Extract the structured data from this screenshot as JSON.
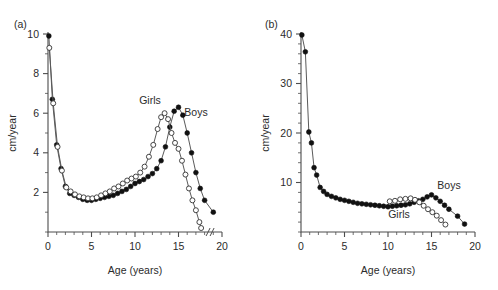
{
  "figure": {
    "panels": [
      {
        "id": "a",
        "label": "(a)",
        "xlabel": "Age (years)",
        "ylabel": "cm/year",
        "xticks": [
          "0",
          "5",
          "10",
          "15",
          "20"
        ],
        "yticks": [
          "2",
          "4",
          "6",
          "8",
          "10"
        ],
        "boys_label": "Boys",
        "girls_label": "Girls",
        "axis_break": "//"
      },
      {
        "id": "b",
        "label": "(b)",
        "xlabel": "Age (years)",
        "ylabel": "cm/year",
        "xticks": [
          "0",
          "5",
          "10",
          "15",
          "20"
        ],
        "yticks": [
          "10",
          "20",
          "30",
          "40"
        ],
        "boys_label": "Boys",
        "girls_label": "Girls",
        "axis_break": ""
      }
    ]
  },
  "chart_data": [
    {
      "type": "line",
      "panel": "a",
      "title": "(a)",
      "xlabel": "Age (years)",
      "ylabel": "cm/year",
      "xlim": [
        0,
        20
      ],
      "ylim": [
        0,
        10
      ],
      "xticks": [
        0,
        5,
        10,
        15,
        20
      ],
      "yticks": [
        2,
        4,
        6,
        8,
        10
      ],
      "xtick_minor_step": 1,
      "ytick_minor_step": 1,
      "grid": false,
      "legend": "inline-annotation",
      "axis_break_x": 18.4,
      "series": [
        {
          "name": "Boys",
          "marker": "filled-circle",
          "x": [
            0.1,
            0.5,
            1.0,
            1.5,
            2.0,
            2.5,
            3.0,
            3.5,
            4.0,
            4.5,
            5.0,
            5.5,
            6.0,
            6.5,
            7.0,
            7.5,
            8.0,
            8.5,
            9.0,
            9.5,
            10.0,
            10.5,
            11.0,
            11.5,
            12.0,
            12.5,
            13.0,
            13.5,
            14.0,
            14.5,
            15.0,
            15.5,
            16.0,
            16.5,
            17.0,
            17.5,
            18.0,
            19.0
          ],
          "y": [
            9.9,
            6.7,
            4.4,
            3.2,
            2.3,
            1.95,
            1.85,
            1.75,
            1.65,
            1.6,
            1.6,
            1.65,
            1.7,
            1.75,
            1.8,
            1.85,
            1.95,
            2.05,
            2.15,
            2.3,
            2.45,
            2.55,
            2.65,
            2.8,
            2.95,
            3.2,
            3.6,
            4.3,
            5.3,
            6.1,
            6.3,
            5.9,
            5.0,
            4.0,
            3.0,
            2.2,
            1.6,
            1.0
          ]
        },
        {
          "name": "Girls",
          "marker": "open-circle",
          "x": [
            0.15,
            0.6,
            1.1,
            1.6,
            2.1,
            2.6,
            3.1,
            3.6,
            4.1,
            4.6,
            5.1,
            5.6,
            6.1,
            6.6,
            7.1,
            7.6,
            8.1,
            8.6,
            9.1,
            9.6,
            10.1,
            10.6,
            11.1,
            11.6,
            12.1,
            12.6,
            13.0,
            13.4,
            13.8,
            14.2,
            14.6,
            15.0,
            15.4,
            15.8,
            16.2,
            16.6,
            17.0,
            17.4,
            17.6
          ],
          "y": [
            9.3,
            6.5,
            4.3,
            3.1,
            2.25,
            2.05,
            1.9,
            1.8,
            1.75,
            1.7,
            1.7,
            1.75,
            1.85,
            1.95,
            2.05,
            2.2,
            2.3,
            2.45,
            2.6,
            2.7,
            2.8,
            3.0,
            3.3,
            3.8,
            4.4,
            5.2,
            5.8,
            6.0,
            5.7,
            5.0,
            4.5,
            4.2,
            3.6,
            2.9,
            2.2,
            1.6,
            1.1,
            0.5,
            0.2
          ]
        }
      ]
    },
    {
      "type": "line",
      "panel": "b",
      "title": "(b)",
      "xlabel": "Age (years)",
      "ylabel": "cm/year",
      "xlim": [
        0,
        20
      ],
      "ylim": [
        0,
        40
      ],
      "xticks": [
        0,
        5,
        10,
        15,
        20
      ],
      "yticks": [
        10,
        20,
        30,
        40
      ],
      "xtick_minor_step": 1,
      "ytick_minor_step": 2,
      "grid": false,
      "legend": "inline-annotation",
      "series": [
        {
          "name": "Boys",
          "marker": "filled-circle",
          "x": [
            0.1,
            0.5,
            0.9,
            1.2,
            1.5,
            1.8,
            2.2,
            2.6,
            3.0,
            3.5,
            4.0,
            4.5,
            5.0,
            5.5,
            6.0,
            6.5,
            7.0,
            7.5,
            8.0,
            8.5,
            9.0,
            9.5,
            10.0,
            10.5,
            11.0,
            11.5,
            12.0,
            12.5,
            13.0,
            13.5,
            14.0,
            14.5,
            15.0,
            15.5,
            16.0,
            16.5,
            17.0,
            18.0,
            18.8
          ],
          "y": [
            39.8,
            36.4,
            20.2,
            18.0,
            13.0,
            11.5,
            9.0,
            8.2,
            7.6,
            7.2,
            6.9,
            6.6,
            6.4,
            6.2,
            6.0,
            5.8,
            5.7,
            5.6,
            5.5,
            5.4,
            5.3,
            5.2,
            5.1,
            5.2,
            5.3,
            5.4,
            5.5,
            5.7,
            6.0,
            6.3,
            6.6,
            7.1,
            7.5,
            6.9,
            6.2,
            5.4,
            4.6,
            3.2,
            1.6
          ]
        },
        {
          "name": "Girls",
          "marker": "open-circle",
          "x": [
            10.2,
            10.8,
            11.4,
            12.0,
            12.6,
            13.1,
            13.6,
            14.1,
            14.6,
            15.1,
            15.6,
            16.1,
            16.6
          ],
          "y": [
            6.2,
            6.3,
            6.6,
            6.7,
            6.8,
            6.5,
            6.0,
            5.3,
            4.6,
            4.0,
            3.3,
            2.4,
            1.5
          ]
        }
      ]
    }
  ]
}
